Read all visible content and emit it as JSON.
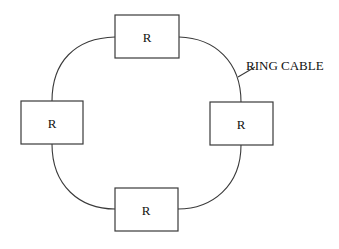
{
  "diagram": {
    "type": "ring-network-topology",
    "nodes": [
      {
        "id": "top",
        "label": "R"
      },
      {
        "id": "left",
        "label": "R"
      },
      {
        "id": "right",
        "label": "R"
      },
      {
        "id": "bottom",
        "label": "R"
      }
    ],
    "cable_label": "RING CABLE",
    "colors": {
      "stroke": "#3a3a3a",
      "text": "#111111",
      "background": "#ffffff"
    }
  }
}
